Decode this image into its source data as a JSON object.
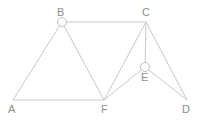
{
  "diagram": {
    "type": "undirected-graph",
    "title": "",
    "canvas": {
      "width": 211,
      "height": 125,
      "background": "#ffffff"
    },
    "style": {
      "edge_color": "#c9c9c9",
      "edge_width": 1,
      "label_color": "#8d8d8d",
      "marker_fill": "#ffffff",
      "marker_stroke": "#c0c0c0",
      "marker_radius": 4.5,
      "label_font_size": 11
    },
    "nodes": [
      {
        "id": "A",
        "label": "A",
        "x": 13,
        "y": 100,
        "marker": "none",
        "label_x": 8,
        "label_y": 104
      },
      {
        "id": "B",
        "label": "B",
        "x": 62,
        "y": 22,
        "marker": "circle",
        "label_x": 57,
        "label_y": 7
      },
      {
        "id": "C",
        "label": "C",
        "x": 146,
        "y": 22,
        "marker": "none",
        "label_x": 142,
        "label_y": 7
      },
      {
        "id": "D",
        "label": "D",
        "x": 187,
        "y": 100,
        "marker": "none",
        "label_x": 182,
        "label_y": 104
      },
      {
        "id": "E",
        "label": "E",
        "x": 145,
        "y": 67,
        "marker": "circle",
        "label_x": 141,
        "label_y": 72
      },
      {
        "id": "F",
        "label": "F",
        "x": 104,
        "y": 100,
        "marker": "none",
        "label_x": 101,
        "label_y": 104
      }
    ],
    "edges": [
      {
        "id": "edge-a-b",
        "from": "A",
        "to": "B"
      },
      {
        "id": "edge-a-f",
        "from": "A",
        "to": "F"
      },
      {
        "id": "edge-b-c",
        "from": "B",
        "to": "C"
      },
      {
        "id": "edge-b-f",
        "from": "B",
        "to": "F"
      },
      {
        "id": "edge-c-f",
        "from": "C",
        "to": "F"
      },
      {
        "id": "edge-c-e",
        "from": "C",
        "to": "E"
      },
      {
        "id": "edge-c-d",
        "from": "C",
        "to": "D"
      },
      {
        "id": "edge-e-f",
        "from": "E",
        "to": "F"
      },
      {
        "id": "edge-e-d",
        "from": "E",
        "to": "D"
      }
    ]
  }
}
